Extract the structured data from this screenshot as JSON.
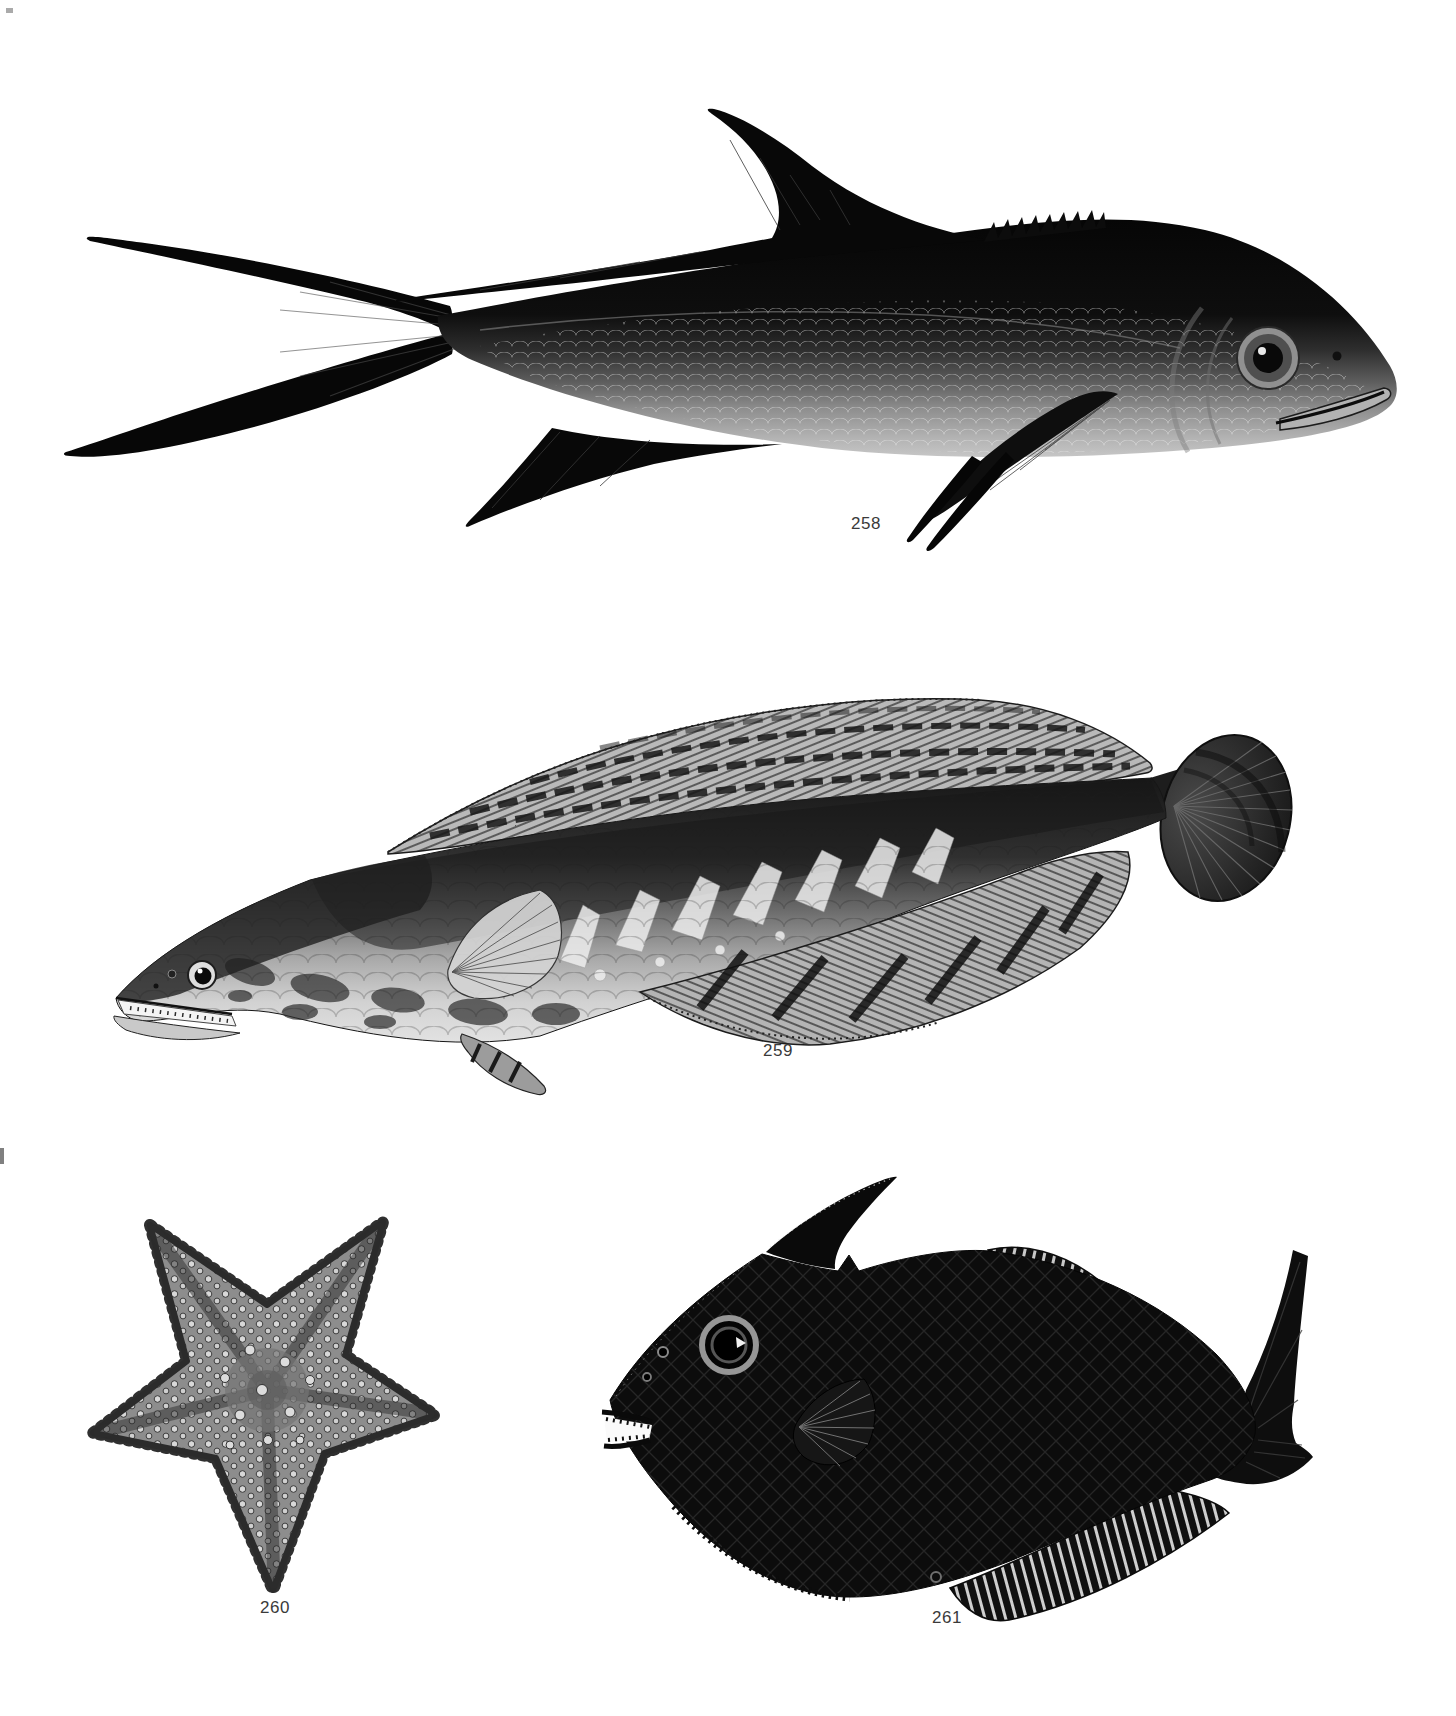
{
  "palette": {
    "background": "#ffffff",
    "ink": "#0c0c0c",
    "midtone": "#8a8a8a",
    "caption_color": "#3a3a3a"
  },
  "figures": [
    {
      "label": "258",
      "subject": "forked-tail-fish"
    },
    {
      "label": "259",
      "subject": "snakehead-fish"
    },
    {
      "label": "260",
      "subject": "sea-star"
    },
    {
      "label": "261",
      "subject": "filefish"
    }
  ]
}
